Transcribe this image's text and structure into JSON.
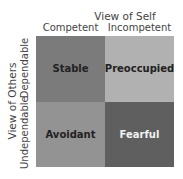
{
  "diagram": {
    "top_axis": {
      "title": "View of Self",
      "columns": [
        "Competent",
        "Incompetent"
      ]
    },
    "left_axis": {
      "title": "View of Others",
      "rows": [
        "Dependable",
        "Undependable"
      ]
    },
    "cells": [
      {
        "label": "Stable",
        "color": "#7b7b7b",
        "text_color": "#222222"
      },
      {
        "label": "Preoccupied",
        "color": "#b1b1b1",
        "text_color": "#222222"
      },
      {
        "label": "Avoidant",
        "color": "#939393",
        "text_color": "#222222"
      },
      {
        "label": "Fearful",
        "color": "#5f5f5f",
        "text_color": "#f2f2f2"
      }
    ]
  }
}
